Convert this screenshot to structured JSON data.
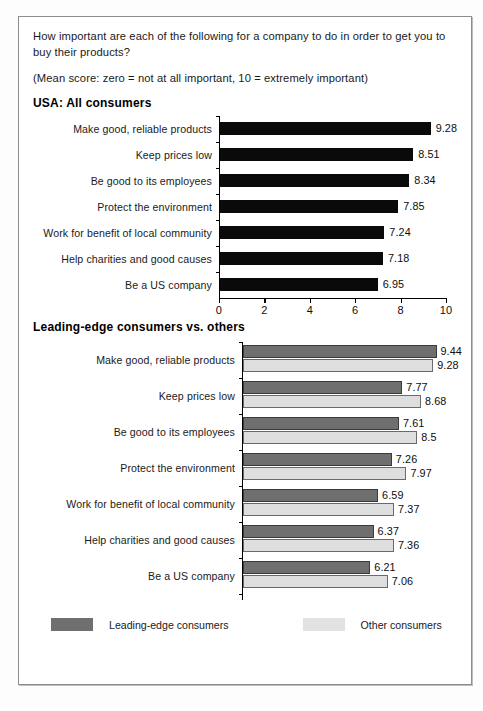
{
  "intro": {
    "question": "How important are each of the following for a company to do in order to get you to buy their products?",
    "scale_note": "(Mean score: zero = not at all important, 10 = extremely important)"
  },
  "chart_data": [
    {
      "type": "bar",
      "title": "USA: All consumers",
      "orientation": "horizontal",
      "categories": [
        "Make good, reliable products",
        "Keep prices low",
        "Be good to its employees",
        "Protect the environment",
        "Work for benefit of local community",
        "Help charities and good causes",
        "Be a US company"
      ],
      "values": [
        9.28,
        8.51,
        8.34,
        7.85,
        7.24,
        7.18,
        6.95
      ],
      "value_labels": [
        "9.28",
        "8.51",
        "8.34",
        "7.85",
        "7.24",
        "7.18",
        "6.95"
      ],
      "xlabel": "",
      "ylabel": "",
      "xlim": [
        0,
        10
      ],
      "xticks": [
        0,
        2,
        4,
        6,
        8,
        10
      ],
      "xtick_labels": [
        "0",
        "2",
        "4",
        "6",
        "8",
        "10"
      ],
      "grid": false,
      "legend": false,
      "bar_color": "#0a0a0a"
    },
    {
      "type": "bar",
      "title": "Leading-edge consumers vs. others",
      "orientation": "horizontal",
      "categories": [
        "Make good, reliable products",
        "Keep prices low",
        "Be good to its employees",
        "Protect the environment",
        "Work for benefit of local community",
        "Help charities and good causes",
        "Be a US company"
      ],
      "series": [
        {
          "name": "Leading-edge consumers",
          "color": "#6f6f6f",
          "values": [
            9.44,
            7.77,
            7.61,
            7.26,
            6.59,
            6.37,
            6.21
          ],
          "value_labels": [
            "9.44",
            "7.77",
            "7.61",
            "7.26",
            "6.59",
            "6.37",
            "6.21"
          ]
        },
        {
          "name": "Other consumers",
          "color": "#dedede",
          "values": [
            9.28,
            8.68,
            8.5,
            7.97,
            7.37,
            7.36,
            7.06
          ],
          "value_labels": [
            "9.28",
            "8.68",
            "8.5",
            "7.97",
            "7.37",
            "7.36",
            "7.06"
          ]
        }
      ],
      "xlabel": "",
      "ylabel": "",
      "xlim": [
        0,
        10
      ],
      "xticks": [],
      "xtick_labels": [],
      "grid": false,
      "legend": true,
      "legend_position": "bottom-left"
    }
  ]
}
